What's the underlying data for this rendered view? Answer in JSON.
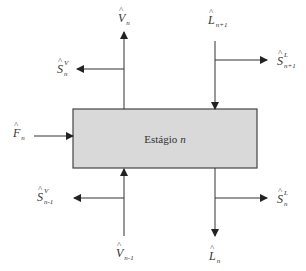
{
  "diagram": {
    "stage": {
      "label": "Estágio",
      "index": "n",
      "fill": "#d9d9d9",
      "border": "#444444"
    },
    "streams": {
      "V_out": {
        "base": "V",
        "hat": "^",
        "sub": "n",
        "sup": "",
        "direction": "up"
      },
      "V_in": {
        "base": "V",
        "hat": "^",
        "sub": "n-1",
        "sup": "",
        "direction": "up"
      },
      "L_in": {
        "base": "L",
        "hat": "^",
        "sub": "n+1",
        "sup": "",
        "direction": "down"
      },
      "L_out": {
        "base": "L",
        "hat": "^",
        "sub": "n",
        "sup": "",
        "direction": "down"
      },
      "F": {
        "base": "F",
        "hat": "^",
        "sub": "n",
        "sup": "",
        "direction": "right"
      },
      "SV_n": {
        "base": "S",
        "hat": "^",
        "sub": "n",
        "sup": "V",
        "direction": "left"
      },
      "SV_nm1": {
        "base": "S",
        "hat": "^",
        "sub": "n-1",
        "sup": "V",
        "direction": "left"
      },
      "SL_np1": {
        "base": "S",
        "hat": "^",
        "sub": "n+1",
        "sup": "L",
        "direction": "right"
      },
      "SL_n": {
        "base": "S",
        "hat": "^",
        "sub": "n",
        "sup": "L",
        "direction": "right"
      }
    },
    "line_color": "#333333"
  }
}
